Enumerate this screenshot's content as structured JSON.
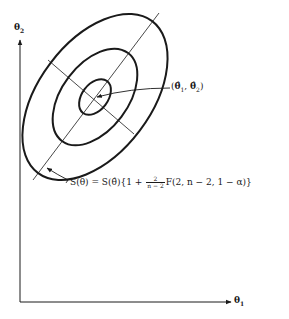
{
  "diagram": {
    "axes": {
      "y_label": "θ",
      "y_label_sub": "2",
      "x_label": "θ",
      "x_label_sub": "1"
    },
    "ellipses": [
      {
        "name": "inner",
        "cx": 95,
        "cy": 97,
        "rx": 21,
        "ry": 13,
        "rotation": -53
      },
      {
        "name": "middle",
        "cx": 94,
        "cy": 97,
        "rx": 56,
        "ry": 33,
        "rotation": -53
      },
      {
        "name": "outer",
        "cx": 95,
        "cy": 97,
        "rx": 96,
        "ry": 56,
        "rotation": -53
      }
    ],
    "center_label": {
      "open": "(",
      "theta1": "θ̂",
      "sub1": "1",
      "sep": ", ",
      "theta2": "θ̂",
      "sub2": "2",
      "close": ")"
    },
    "contour_label": {
      "lhs": "S(θ) = S(θ̂){1 + ",
      "frac_num": "2",
      "frac_den": "n − 2",
      "rhs": "F(2, n − 2, 1 − α)}"
    },
    "colors": {
      "ink": "#1a1a1a",
      "background": "#ffffff"
    }
  }
}
